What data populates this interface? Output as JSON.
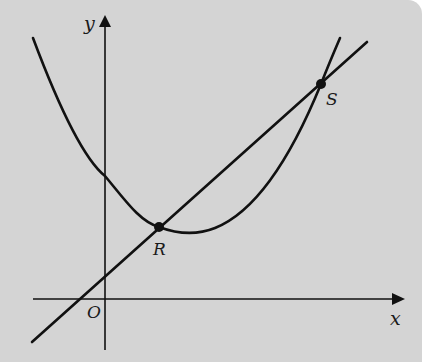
{
  "diagram": {
    "type": "coordinate-graph",
    "axes": {
      "x_label": "x",
      "y_label": "y",
      "origin_label": "O"
    },
    "curves": [
      {
        "name": "parabola",
        "kind": "curve"
      },
      {
        "name": "line",
        "kind": "straight-line"
      }
    ],
    "points": [
      {
        "label": "R",
        "description": "intersection of line and curve near curve minimum"
      },
      {
        "label": "S",
        "description": "upper-right intersection of line and curve"
      }
    ],
    "colors": {
      "background": "#d4d4d4",
      "stroke": "#111111"
    }
  }
}
